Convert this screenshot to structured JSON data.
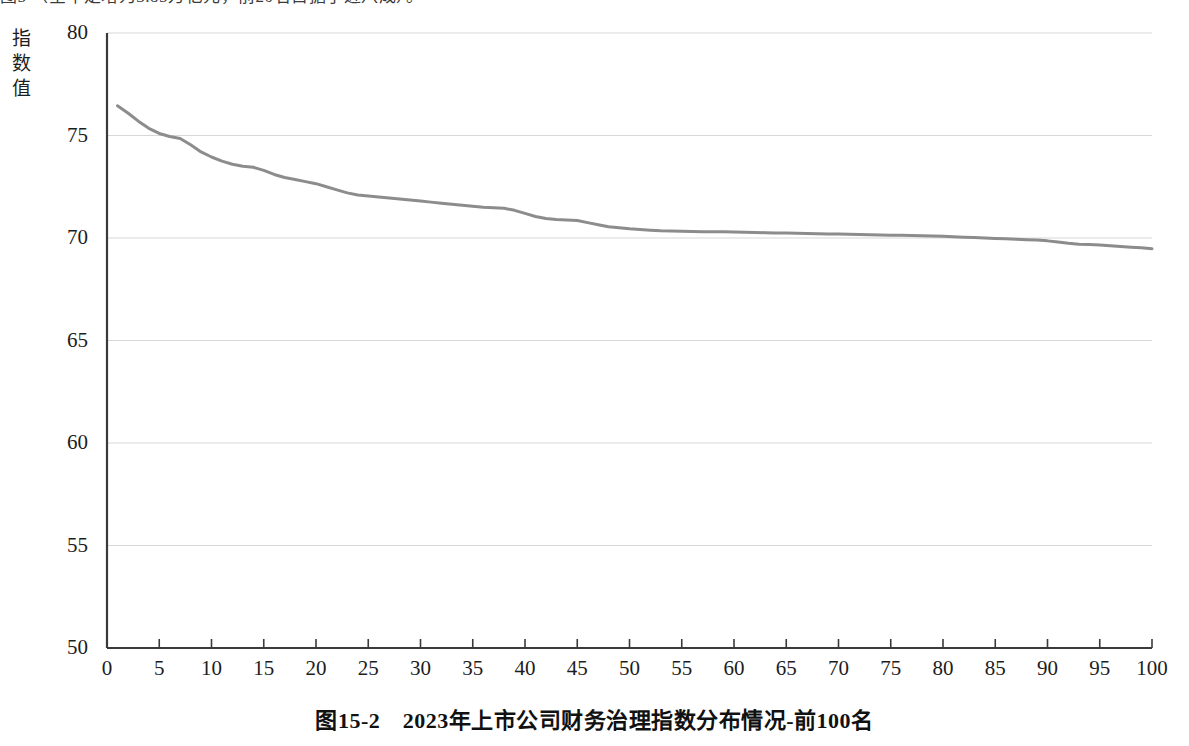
{
  "page": {
    "top_text_partial": "图5 （全年定增为3.85万亿元，前20名占据了近八成）。"
  },
  "figure": {
    "caption": "图15-2　2023年上市公司财务治理指数分布情况-前100名",
    "y_axis_title": "指数值"
  },
  "chart_data": {
    "type": "line",
    "title": "",
    "subtitle": "",
    "xlabel": "",
    "ylabel": "指数值",
    "xlim": [
      0,
      100
    ],
    "ylim": [
      50,
      80
    ],
    "xticks": [
      0,
      5,
      10,
      15,
      20,
      25,
      30,
      35,
      40,
      45,
      50,
      55,
      60,
      65,
      70,
      75,
      80,
      85,
      90,
      95,
      100
    ],
    "yticks": [
      50,
      55,
      60,
      65,
      70,
      75,
      80
    ],
    "grid": "horizontal",
    "legend": "none",
    "line_color": "#8c8c8c",
    "line_width": 3,
    "series": [
      {
        "name": "财务治理指数",
        "x": [
          1,
          2,
          3,
          4,
          5,
          6,
          7,
          8,
          9,
          10,
          11,
          12,
          13,
          14,
          15,
          16,
          17,
          18,
          19,
          20,
          21,
          22,
          23,
          24,
          25,
          26,
          27,
          28,
          29,
          30,
          31,
          32,
          33,
          34,
          35,
          36,
          37,
          38,
          39,
          40,
          41,
          42,
          43,
          44,
          45,
          46,
          47,
          48,
          49,
          50,
          51,
          52,
          53,
          54,
          55,
          56,
          57,
          58,
          59,
          60,
          61,
          62,
          63,
          64,
          65,
          66,
          67,
          68,
          69,
          70,
          71,
          72,
          73,
          74,
          75,
          76,
          77,
          78,
          79,
          80,
          81,
          82,
          83,
          84,
          85,
          86,
          87,
          88,
          89,
          90,
          91,
          92,
          93,
          94,
          95,
          96,
          97,
          98,
          99,
          100
        ],
        "values": [
          76.45,
          76.1,
          75.7,
          75.35,
          75.1,
          74.95,
          74.85,
          74.55,
          74.2,
          73.95,
          73.75,
          73.6,
          73.5,
          73.45,
          73.3,
          73.1,
          72.95,
          72.85,
          72.75,
          72.65,
          72.5,
          72.35,
          72.2,
          72.1,
          72.05,
          72.0,
          71.95,
          71.9,
          71.85,
          71.8,
          71.75,
          71.7,
          71.65,
          71.6,
          71.55,
          71.5,
          71.48,
          71.45,
          71.35,
          71.2,
          71.05,
          70.95,
          70.9,
          70.88,
          70.85,
          70.75,
          70.65,
          70.55,
          70.5,
          70.45,
          70.42,
          70.38,
          70.35,
          70.34,
          70.33,
          70.32,
          70.31,
          70.3,
          70.3,
          70.29,
          70.28,
          70.27,
          70.26,
          70.25,
          70.24,
          70.23,
          70.22,
          70.21,
          70.2,
          70.19,
          70.18,
          70.17,
          70.16,
          70.15,
          70.14,
          70.13,
          70.12,
          70.11,
          70.1,
          70.08,
          70.06,
          70.04,
          70.02,
          70.0,
          69.98,
          69.96,
          69.94,
          69.92,
          69.9,
          69.86,
          69.8,
          69.74,
          69.7,
          69.68,
          69.66,
          69.62,
          69.58,
          69.55,
          69.52,
          69.48
        ]
      }
    ]
  }
}
